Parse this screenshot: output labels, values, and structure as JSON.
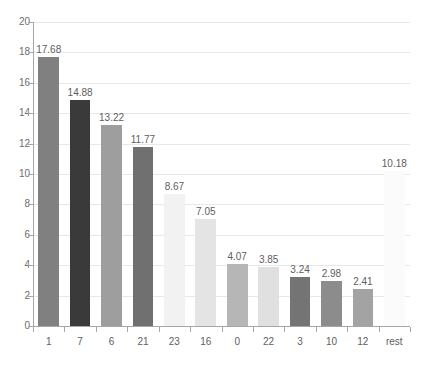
{
  "chart_data": {
    "type": "bar",
    "title": "",
    "xlabel": "",
    "ylabel": "",
    "ylim": [
      0,
      20
    ],
    "ytick_step": 2,
    "yticks": [
      "20",
      "18",
      "16",
      "14",
      "12",
      "10",
      "8",
      "6",
      "4",
      "2",
      "0"
    ],
    "grid": true,
    "legend": "none",
    "categories": [
      "1",
      "7",
      "6",
      "21",
      "23",
      "16",
      "0",
      "22",
      "3",
      "10",
      "12",
      "rest"
    ],
    "values": [
      17.68,
      14.88,
      13.22,
      11.77,
      8.67,
      7.05,
      4.07,
      3.85,
      3.24,
      2.98,
      2.41,
      10.18
    ],
    "value_labels": [
      "17.68",
      "14.88",
      "13.22",
      "11.77",
      "8.67",
      "7.05",
      "4.07",
      "3.85",
      "3.24",
      "2.98",
      "2.41",
      "10.18"
    ],
    "bar_colors": [
      "#808080",
      "#3a3a3a",
      "#9e9e9e",
      "#707070",
      "#f2f2f2",
      "#e4e4e4",
      "#b6b6b6",
      "#e0e0e0",
      "#747474",
      "#8c8c8c",
      "#a3a3a3",
      "#fbfbfb"
    ]
  },
  "colors": {
    "gridline": "#e8e8e8",
    "axis": "#a6a6a6",
    "text": "#5e5e5e",
    "background": "#ffffff"
  }
}
